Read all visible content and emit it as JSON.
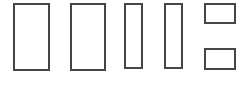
{
  "figure": {
    "width": 248,
    "height": 85,
    "background_color": "#ffffff",
    "stroke_color": "#454545",
    "fill_color": "#ffffff",
    "stroke_width": 2,
    "shape_count": 6
  },
  "chart_data": {
    "type": "bar",
    "title": "",
    "subtitle": "",
    "xlabel": "",
    "ylabel": "",
    "grid": false,
    "legend": null,
    "axis_visible": false,
    "categories": [
      "1",
      "2",
      "3",
      "4",
      "5a",
      "5b"
    ],
    "values": [
      68,
      68,
      66,
      66,
      21,
      22
    ],
    "widths": [
      37,
      36,
      19,
      19,
      32,
      32
    ],
    "xlim": [
      0,
      248
    ],
    "ylim": [
      0,
      85
    ],
    "note": "Six unfilled rectangles outlined in dark gray on white; widths decrease left to right, rightmost column split into two short boxes."
  },
  "shapes": [
    {
      "name": "rectangle-1",
      "label": "1",
      "x": 13,
      "y": 3,
      "width": 37,
      "height": 68,
      "stroke": "#454545",
      "fill": "#ffffff",
      "stroke_width": 2
    },
    {
      "name": "rectangle-2",
      "label": "2",
      "x": 70,
      "y": 3,
      "width": 36,
      "height": 68,
      "stroke": "#454545",
      "fill": "#ffffff",
      "stroke_width": 2
    },
    {
      "name": "rectangle-3",
      "label": "3",
      "x": 124,
      "y": 3,
      "width": 19,
      "height": 66,
      "stroke": "#454545",
      "fill": "#ffffff",
      "stroke_width": 2
    },
    {
      "name": "rectangle-4",
      "label": "4",
      "x": 164,
      "y": 3,
      "width": 19,
      "height": 66,
      "stroke": "#454545",
      "fill": "#ffffff",
      "stroke_width": 2
    },
    {
      "name": "rectangle-5-top",
      "label": "5a",
      "x": 204,
      "y": 3,
      "width": 32,
      "height": 21,
      "stroke": "#454545",
      "fill": "#ffffff",
      "stroke_width": 2
    },
    {
      "name": "rectangle-5-bottom",
      "label": "5b",
      "x": 204,
      "y": 48,
      "width": 32,
      "height": 22,
      "stroke": "#454545",
      "fill": "#ffffff",
      "stroke_width": 2
    }
  ]
}
